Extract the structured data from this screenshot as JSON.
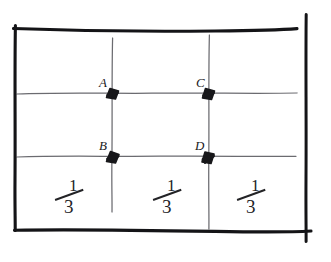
{
  "figure": {
    "background_color": "#ffffff",
    "ink_color": "#19191c",
    "grid_line_color": "#6b6b70",
    "border_color": "#141417"
  },
  "points": [
    {
      "id": "A",
      "label": "A",
      "x": 112,
      "y": 93,
      "label_x": 99,
      "label_y": 76
    },
    {
      "id": "B",
      "label": "B",
      "x": 112,
      "y": 156,
      "label_x": 99,
      "label_y": 139
    },
    {
      "id": "C",
      "label": "C",
      "x": 209,
      "y": 93,
      "label_x": 196,
      "label_y": 76
    },
    {
      "id": "D",
      "label": "D",
      "x": 209,
      "y": 156,
      "label_x": 195,
      "label_y": 139
    }
  ],
  "fractions": [
    {
      "id": "left-third",
      "numerator": "1",
      "denominator": "3",
      "x": 52,
      "y": 176
    },
    {
      "id": "middle-third",
      "numerator": "1",
      "denominator": "3",
      "x": 150,
      "y": 176
    },
    {
      "id": "right-third",
      "numerator": "1",
      "denominator": "3",
      "x": 234,
      "y": 176
    }
  ],
  "grid": {
    "vertical_lines": [
      {
        "id": "vertical-line-1",
        "x": 112
      },
      {
        "id": "vertical-line-2",
        "x": 209
      }
    ],
    "horizontal_lines": [
      {
        "id": "horizontal-line-upper",
        "y": 93
      },
      {
        "id": "horizontal-line-lower",
        "y": 156
      }
    ]
  },
  "border": {
    "left": 15,
    "right": 306,
    "top": 28,
    "bottom": 230
  }
}
